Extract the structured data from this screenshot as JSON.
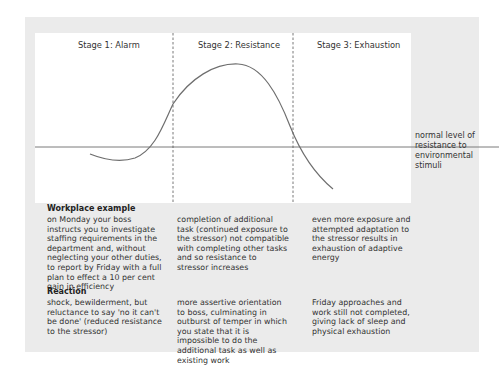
{
  "diagram": {
    "stages": [
      {
        "label": "Stage 1: Alarm"
      },
      {
        "label": "Stage 2: Resistance"
      },
      {
        "label": "Stage 3: Exhaustion"
      }
    ],
    "baseline_label": "normal level of resistance to environmental stimuli",
    "curve_description": "resistance dips below normal in alarm, rises above normal and peaks during resistance, falls below normal in exhaustion",
    "colors": {
      "panel": "#ebebeb",
      "chart_bg": "#ffffff",
      "line": "#6e6e6e"
    }
  },
  "workplace_example": {
    "title": "Workplace example",
    "cells": [
      "on Monday your boss instructs you to investigate staffing requirements in the department and, without neglecting your other duties, to report by Friday with a full plan to effect a 10 per cent gain in efficiency",
      "completion of additional task (continued exposure to the stressor) not compatible with completing other tasks and so resistance to stressor increases",
      "even more exposure and attempted adaptation to the stressor results in exhaustion of adaptive energy"
    ]
  },
  "reaction": {
    "title": "Reaction",
    "cells": [
      "shock, bewilderment, but reluctance to say 'no it can't be done' (reduced resistance to the stressor)",
      "more assertive orientation to boss, culminating in outburst of temper in which you state that it is impossible to do the additional task as well as existing work",
      "Friday approaches and work still not completed, giving lack of sleep and physical exhaustion"
    ]
  }
}
